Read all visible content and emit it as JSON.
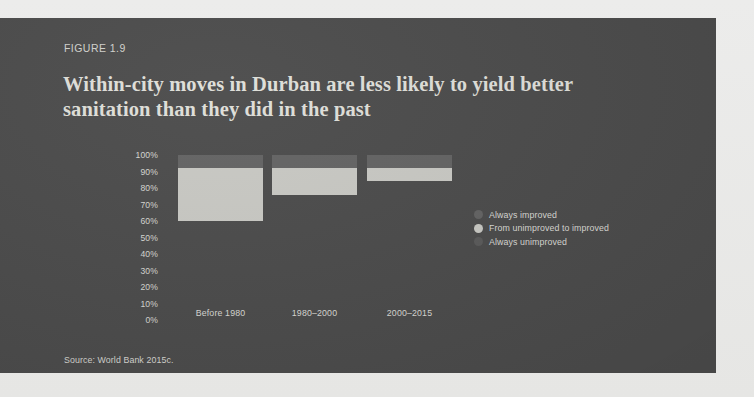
{
  "figure": {
    "label": "FIGURE 1.9",
    "title": "Within-city moves in Durban are less likely to yield better sanitation than they did in the past",
    "source": "Source: World Bank 2015c."
  },
  "colors": {
    "page_background": "#e9e9e7",
    "panel_background": "#4b4b4b",
    "text_light": "#d8d8d3",
    "title_text": "#dedeD8",
    "always_improved": "#636363",
    "from_unimproved_to_improved": "#c8c8c3",
    "always_unimproved": "#4b4b4b"
  },
  "legend": {
    "position": "right",
    "items": [
      {
        "label": "Always improved",
        "color": "#636363"
      },
      {
        "label": "From unimproved to improved",
        "color": "#c8c8c3"
      },
      {
        "label": "Always unimproved",
        "color": "#5a5a5a"
      }
    ]
  },
  "chart_data": {
    "type": "bar",
    "stacked": true,
    "title": "Within-city moves in Durban are less likely to yield better sanitation than they did in the past",
    "subtitle": "FIGURE 1.9",
    "xlabel": "",
    "ylabel": "",
    "ylim": [
      0,
      100
    ],
    "y_unit": "%",
    "grid": false,
    "categories": [
      "Before 1980",
      "1980–2000",
      "2000–2015"
    ],
    "y_ticks": [
      "0%",
      "10%",
      "20%",
      "30%",
      "40%",
      "50%",
      "60%",
      "70%",
      "80%",
      "90%",
      "100%"
    ],
    "y_tick_values": [
      0,
      10,
      20,
      30,
      40,
      50,
      60,
      70,
      80,
      90,
      100
    ],
    "series": [
      {
        "name": "Always improved",
        "color": "#636363",
        "values": [
          8,
          8,
          8
        ]
      },
      {
        "name": "From unimproved to improved",
        "color": "#c8c8c3",
        "values": [
          32,
          16,
          8
        ]
      },
      {
        "name": "Always unimproved",
        "color": "#4b4b4b",
        "values": [
          60,
          76,
          84
        ]
      }
    ]
  }
}
